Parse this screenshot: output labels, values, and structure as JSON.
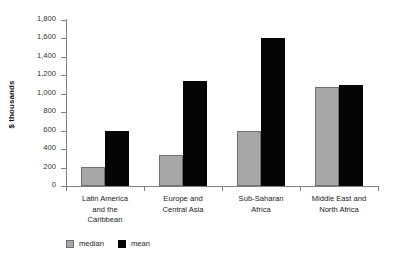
{
  "chart_data": {
    "type": "bar",
    "title": "",
    "xlabel": "",
    "ylabel": "$ thousands",
    "ylim": [
      0,
      1800
    ],
    "ytick_step": 200,
    "yticks": [
      "1,800",
      "1,600",
      "1,400",
      "1,200",
      "1,000",
      "800",
      "600",
      "400",
      "200",
      "0"
    ],
    "ytick_values": [
      1800,
      1600,
      1400,
      1200,
      1000,
      800,
      600,
      400,
      200,
      0
    ],
    "grid": false,
    "legend_position": "bottom-left",
    "categories": [
      "Latin America and the Caribbean",
      "Europe and Central Asia",
      "Sub-Saharan Africa",
      "Middle East and North Africa"
    ],
    "category_lines": [
      [
        "Latin America",
        "and the",
        "Caribbean"
      ],
      [
        "Europe and",
        "Central Asia"
      ],
      [
        "Sub-Saharan",
        "Africa"
      ],
      [
        "Middle East and",
        "North Africa"
      ]
    ],
    "series": [
      {
        "name": "median",
        "color": "#a8a8a8",
        "values": [
          210,
          340,
          600,
          1070
        ]
      },
      {
        "name": "mean",
        "color": "#050505",
        "values": [
          595,
          1140,
          1600,
          1090
        ]
      }
    ]
  }
}
